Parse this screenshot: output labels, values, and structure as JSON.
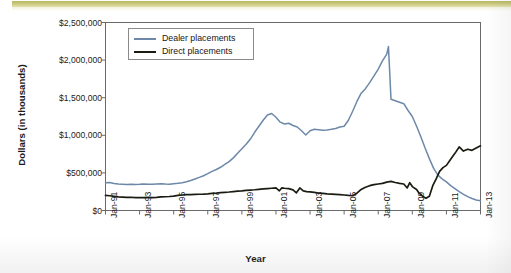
{
  "figure": {
    "axis_title_y": "Dollars (in thousands)",
    "axis_title_x": "Year",
    "legend": {
      "items": [
        {
          "label": "Dealer placements",
          "color": "#6d88a8"
        },
        {
          "label": "Direct placements",
          "color": "#1b1b12"
        }
      ]
    },
    "colors": {
      "dealer": "#6d88a8",
      "direct": "#1b1b12",
      "axis": "#585858",
      "band": "#c2c176",
      "legend_border": "#8a8a8a"
    }
  },
  "chart_data": {
    "type": "line",
    "title": "",
    "xlabel": "Year",
    "ylabel": "Dollars (in thousands)",
    "xlim": [
      1991.0,
      2013.0
    ],
    "ylim": [
      0,
      2500000
    ],
    "grid": false,
    "legend_position": "top-left-inside",
    "ytick_labels": [
      "$0",
      "$500,000",
      "$1,000,000",
      "$1,500,000",
      "$2,000,000",
      "$2,500,000"
    ],
    "ytick_values": [
      0,
      500000,
      1000000,
      1500000,
      2000000,
      2500000
    ],
    "xtick_labels": [
      "Jan-91",
      "Jan-93",
      "Jan-95",
      "Jan-97",
      "Jan-99",
      "Jan-01",
      "Jan-03",
      "Jan-05",
      "Jan-07",
      "Jan-09",
      "Jan-11",
      "Jan-13"
    ],
    "xtick_values": [
      1991,
      1993,
      1995,
      1997,
      1999,
      2001,
      2003,
      2005,
      2007,
      2009,
      2011,
      2013
    ],
    "series": [
      {
        "name": "Dealer placements",
        "color": "#6d88a8",
        "x": [
          1991.0,
          1991.25,
          1991.5,
          1991.75,
          1992.0,
          1992.25,
          1992.5,
          1992.75,
          1993.0,
          1993.25,
          1993.5,
          1993.75,
          1994.0,
          1994.25,
          1994.5,
          1994.75,
          1995.0,
          1995.25,
          1995.5,
          1995.75,
          1996.0,
          1996.25,
          1996.5,
          1996.75,
          1997.0,
          1997.25,
          1997.5,
          1997.75,
          1998.0,
          1998.25,
          1998.5,
          1998.75,
          1999.0,
          1999.25,
          1999.5,
          1999.75,
          2000.0,
          2000.25,
          2000.5,
          2000.75,
          2001.0,
          2001.25,
          2001.5,
          2001.75,
          2002.0,
          2002.25,
          2002.5,
          2002.75,
          2003.0,
          2003.25,
          2003.5,
          2003.75,
          2004.0,
          2004.25,
          2004.5,
          2004.75,
          2005.0,
          2005.25,
          2005.5,
          2005.75,
          2006.0,
          2006.25,
          2006.5,
          2006.75,
          2007.0,
          2007.25,
          2007.5,
          2007.6,
          2007.75,
          2008.0,
          2008.25,
          2008.5,
          2008.75,
          2009.0,
          2009.25,
          2009.5,
          2009.75,
          2010.0,
          2010.25,
          2010.5,
          2010.75,
          2011.0,
          2011.25,
          2011.5,
          2011.75,
          2012.0,
          2012.25,
          2012.5,
          2012.75,
          2013.0
        ],
        "y": [
          370000,
          372000,
          360000,
          352000,
          348000,
          345000,
          350000,
          346000,
          348000,
          352000,
          350000,
          348000,
          352000,
          356000,
          352000,
          350000,
          356000,
          362000,
          370000,
          382000,
          400000,
          420000,
          440000,
          462000,
          490000,
          520000,
          545000,
          575000,
          612000,
          650000,
          700000,
          760000,
          820000,
          880000,
          950000,
          1040000,
          1120000,
          1200000,
          1270000,
          1290000,
          1240000,
          1175000,
          1150000,
          1160000,
          1130000,
          1110000,
          1060000,
          1005000,
          1060000,
          1080000,
          1075000,
          1068000,
          1072000,
          1080000,
          1090000,
          1110000,
          1120000,
          1200000,
          1320000,
          1450000,
          1560000,
          1620000,
          1700000,
          1790000,
          1880000,
          1990000,
          2080000,
          2180000,
          1480000,
          1460000,
          1440000,
          1420000,
          1330000,
          1250000,
          1120000,
          980000,
          830000,
          690000,
          560000,
          470000,
          420000,
          380000,
          330000,
          290000,
          250000,
          215000,
          185000,
          160000,
          140000,
          130000
        ]
      },
      {
        "name": "Direct placements",
        "color": "#1b1b12",
        "x": [
          1991.0,
          1991.25,
          1991.5,
          1991.75,
          1992.0,
          1992.25,
          1992.5,
          1992.75,
          1993.0,
          1993.25,
          1993.5,
          1993.75,
          1994.0,
          1994.25,
          1994.5,
          1994.75,
          1995.0,
          1995.25,
          1995.5,
          1995.75,
          1996.0,
          1996.25,
          1996.5,
          1996.75,
          1997.0,
          1997.25,
          1997.5,
          1997.75,
          1998.0,
          1998.25,
          1998.5,
          1998.75,
          1999.0,
          1999.25,
          1999.5,
          1999.75,
          2000.0,
          2000.25,
          2000.5,
          2000.75,
          2001.0,
          2001.2,
          2001.35,
          2001.5,
          2001.75,
          2002.0,
          2002.2,
          2002.4,
          2002.6,
          2002.8,
          2003.0,
          2003.25,
          2003.5,
          2003.75,
          2004.0,
          2004.25,
          2004.5,
          2004.75,
          2005.0,
          2005.25,
          2005.5,
          2005.75,
          2006.0,
          2006.25,
          2006.5,
          2006.75,
          2007.0,
          2007.25,
          2007.5,
          2007.75,
          2008.0,
          2008.25,
          2008.5,
          2008.7,
          2008.85,
          2009.0,
          2009.25,
          2009.4,
          2009.6,
          2009.8,
          2010.0,
          2010.2,
          2010.4,
          2010.6,
          2010.8,
          2011.0,
          2011.25,
          2011.5,
          2011.75,
          2012.0,
          2012.25,
          2012.5,
          2012.75,
          2013.0
        ],
        "y": [
          200000,
          196000,
          188000,
          180000,
          178000,
          175000,
          176000,
          172000,
          170000,
          172000,
          175000,
          172000,
          175000,
          180000,
          183000,
          186000,
          192000,
          200000,
          206000,
          210000,
          212000,
          214000,
          216000,
          218000,
          222000,
          228000,
          232000,
          238000,
          242000,
          246000,
          252000,
          258000,
          262000,
          268000,
          272000,
          276000,
          282000,
          288000,
          292000,
          296000,
          300000,
          262000,
          302000,
          296000,
          290000,
          275000,
          235000,
          300000,
          262000,
          252000,
          248000,
          240000,
          232000,
          228000,
          222000,
          218000,
          214000,
          210000,
          206000,
          200000,
          196000,
          230000,
          280000,
          310000,
          330000,
          345000,
          352000,
          360000,
          378000,
          388000,
          372000,
          360000,
          352000,
          300000,
          370000,
          318000,
          280000,
          230000,
          190000,
          162000,
          190000,
          330000,
          420000,
          520000,
          570000,
          600000,
          680000,
          760000,
          845000,
          790000,
          815000,
          800000,
          830000,
          860000
        ]
      }
    ]
  }
}
